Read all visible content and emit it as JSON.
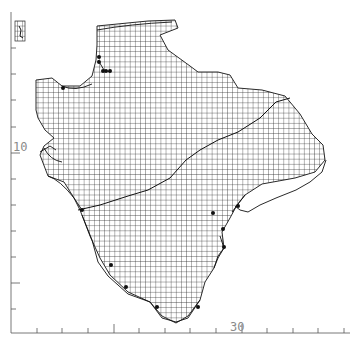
{
  "map": {
    "type": "grid distribution map",
    "axes": {
      "y_label": "10",
      "x_label": "30"
    },
    "colors": {
      "grid": "#2a2a2a",
      "outline": "#111111",
      "axis": "#555555",
      "label": "#8a8a8a",
      "record_dot": "#111111"
    },
    "record_count": 19
  }
}
